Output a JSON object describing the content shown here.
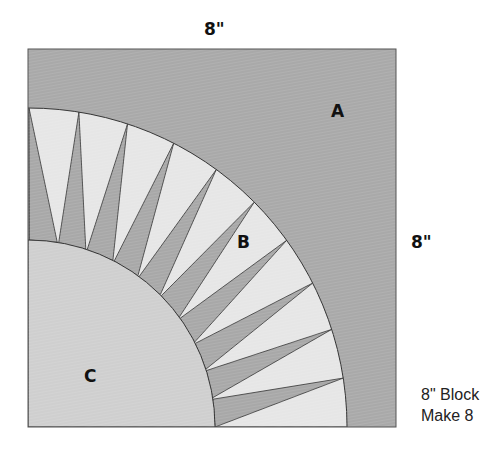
{
  "dimensions": {
    "top": "8\"",
    "right": "8\""
  },
  "pieces": {
    "a": "A",
    "b": "B",
    "c": "C"
  },
  "note": {
    "line1": "8\" Block",
    "line2": "Make 8"
  },
  "colors": {
    "background_a": "#a9a9a9",
    "arc_light": "#e6e6e6",
    "spike_dark": "#a8a8a8",
    "center_c": "#cfcfcf",
    "outline": "#333333"
  },
  "geometry": {
    "block": {
      "x": 28,
      "y": 49,
      "size": 368
    },
    "corner": {
      "x": 28,
      "y": 427
    },
    "outer_radius": 319,
    "inner_radius": 187,
    "spike_count": 10
  }
}
